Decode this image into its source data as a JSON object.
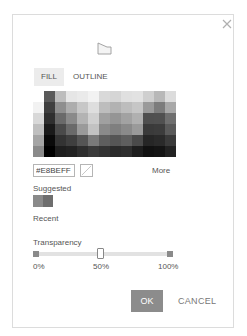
{
  "dialog": {
    "close_icon": "close-icon",
    "shape_icon": "shape-preview-icon"
  },
  "tabs": [
    {
      "label": "FILL",
      "active": true
    },
    {
      "label": "OUTLINE",
      "active": false
    }
  ],
  "color_grid": {
    "columns": 13,
    "rows": 6,
    "cells": [
      [
        "#ffffff",
        "#5a5a5a",
        "#bdbdbd",
        "#e6e6e6",
        "#eaeaea",
        "#f2f2f2",
        "#d9d9d9",
        "#d5d5d5",
        "#e0e0e0",
        "#e2e2e2",
        "#cfcfcf",
        "#b8b8b8",
        "#dcdcdc"
      ],
      [
        "#f2f2f2",
        "#3f3f3f",
        "#8e8e8e",
        "#adadad",
        "#c7c7c7",
        "#dedede",
        "#bdbdbd",
        "#b2b2b2",
        "#bdbdbd",
        "#c6c6c6",
        "#9a9a9a",
        "#7c7c7c",
        "#a8a8a8"
      ],
      [
        "#d8d8d8",
        "#2f2f2f",
        "#6a6a6a",
        "#8a8a8a",
        "#b3b3b3",
        "#d0d0d0",
        "#a0a0a0",
        "#959595",
        "#a2a2a2",
        "#b0b0b0",
        "#4f4f4f",
        "#505050",
        "#6f6f6f"
      ],
      [
        "#bfbfbf",
        "#1a1a1a",
        "#4a4a4a",
        "#6a6a6a",
        "#9a9a9a",
        "#c2c2c2",
        "#8a8a8a",
        "#7f7f7f",
        "#8a8a8a",
        "#9a9a9a",
        "#3a3a3a",
        "#3c3c3c",
        "#5a5a5a"
      ],
      [
        "#a5a5a5",
        "#0a0a0a",
        "#333333",
        "#3f3f3f",
        "#555555",
        "#7a7a7a",
        "#5e5e5e",
        "#555555",
        "#5e5e5e",
        "#4a4a4a",
        "#262626",
        "#2a2a2a",
        "#3a3a3a"
      ],
      [
        "#8a8a8a",
        "#000000",
        "#1e1e1e",
        "#222222",
        "#2e2e2e",
        "#3a3a3a",
        "#333333",
        "#2a2a2a",
        "#2e2e2e",
        "#1e1e1e",
        "#111111",
        "#141414",
        "#222222"
      ]
    ]
  },
  "hex_input": {
    "value": "#E8BEFF"
  },
  "no_color_icon": "no-color-icon",
  "more_label": "More",
  "suggested": {
    "label": "Suggested",
    "swatches": [
      "#8a8a8a",
      "#6e6e6e"
    ]
  },
  "recent": {
    "label": "Recent"
  },
  "transparency": {
    "label": "Transparency",
    "value_percent": 50,
    "ticks": [
      "0%",
      "50%",
      "100%"
    ]
  },
  "buttons": {
    "ok": "OK",
    "cancel": "CANCEL"
  }
}
